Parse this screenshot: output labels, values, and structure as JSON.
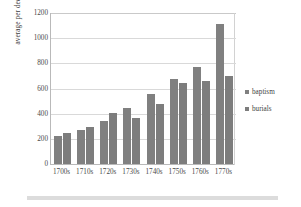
{
  "chart_data": {
    "type": "bar",
    "title": "",
    "xlabel": "",
    "ylabel": "average per decade",
    "ylim": [
      0,
      1200
    ],
    "yticks": [
      0,
      200,
      400,
      600,
      800,
      1000,
      1200
    ],
    "ytick_labels": [
      "0",
      "200",
      "400",
      "600",
      "800",
      "1000",
      "1200"
    ],
    "grid": true,
    "legend_position": "right",
    "categories": [
      "1700s",
      "1710s",
      "1720s",
      "1730s",
      "1740s",
      "1750s",
      "1760s",
      "1770s"
    ],
    "series": [
      {
        "name": "baptism",
        "color": "#808080",
        "values": [
          225,
          272,
          345,
          443,
          558,
          678,
          773,
          1110
        ]
      },
      {
        "name": "burials",
        "color": "#7d7d7d",
        "values": [
          244,
          295,
          405,
          368,
          477,
          647,
          658,
          703
        ]
      }
    ]
  },
  "legend": {
    "items": [
      {
        "label": "baptism",
        "color": "#808080"
      },
      {
        "label": "burials",
        "color": "#7d7d7d"
      }
    ]
  }
}
